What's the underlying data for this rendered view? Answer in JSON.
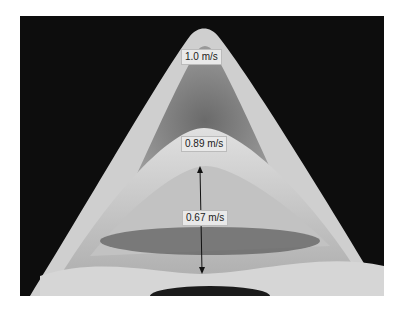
{
  "figure": {
    "labels": [
      {
        "text": "1.0 m/s"
      },
      {
        "text": "0.89 m/s"
      },
      {
        "text": "0.67 m/s"
      }
    ],
    "colors": {
      "background": "#0d0d0d",
      "shape_light": "#d8d8d8",
      "shape_mid": "#9a9a9a",
      "label_bg": "#e9e9e9"
    }
  }
}
